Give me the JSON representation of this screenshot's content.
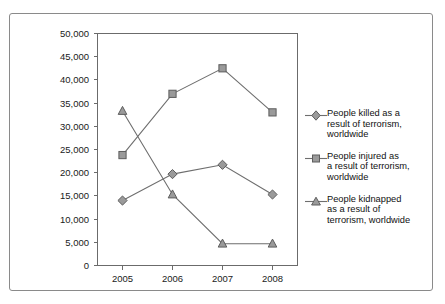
{
  "chart_data": {
    "type": "line",
    "title": "",
    "xlabel": "",
    "ylabel": "",
    "categories": [
      "2005",
      "2006",
      "2007",
      "2008"
    ],
    "ylim": [
      0,
      50000
    ],
    "yticks": [
      "0",
      "5,000",
      "10,000",
      "15,000",
      "20,000",
      "25,000",
      "30,000",
      "35,000",
      "40,000",
      "45,000",
      "50,000"
    ],
    "ytick_values": [
      0,
      5000,
      10000,
      15000,
      20000,
      25000,
      30000,
      35000,
      40000,
      45000,
      50000
    ],
    "grid": false,
    "legend_position": "right",
    "series": [
      {
        "name": "People killed as a\nresult of terrorism,\nworldwide",
        "marker": "diamond",
        "color": "#9a9a9a",
        "values": [
          14000,
          19700,
          21700,
          15300
        ]
      },
      {
        "name": "People injured as\na result of terrorism,\nworldwide",
        "marker": "square",
        "color": "#9a9a9a",
        "values": [
          23800,
          37000,
          42500,
          33000
        ]
      },
      {
        "name": "People kidnapped\nas a result of\nterrorism, worldwide",
        "marker": "triangle",
        "color": "#9a9a9a",
        "values": [
          33300,
          15300,
          4700,
          4700
        ]
      }
    ]
  },
  "legend": {
    "items": [
      {
        "label": "People killed as a\nresult of terrorism,\nworldwide",
        "marker": "diamond"
      },
      {
        "label": "People injured as\na result of terrorism,\nworldwide",
        "marker": "square"
      },
      {
        "label": "People kidnapped\nas a result of\nterrorism, worldwide",
        "marker": "triangle"
      }
    ]
  },
  "colors": {
    "marker_fill": "#9a9a9a",
    "marker_stroke": "#5d5d5d",
    "line": "#6e6e6e",
    "axis": "#6b6b6b",
    "frame": "#8a8a8a",
    "text": "#111111",
    "background": "#ffffff"
  }
}
